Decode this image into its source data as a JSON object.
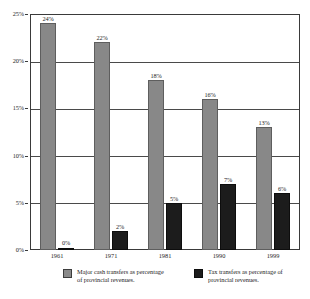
{
  "chart_data": {
    "type": "bar",
    "title": "",
    "subtitle": "",
    "xlabel": "",
    "ylabel": "",
    "categories": [
      "1961",
      "1971",
      "1981",
      "1990",
      "1999"
    ],
    "series": [
      {
        "name": "Major cash transfers as percentage of provincial revenues.",
        "color": "#888888",
        "values": [
          24,
          22,
          18,
          16,
          13
        ],
        "labels": [
          "24%",
          "22%",
          "18%",
          "16%",
          "13%"
        ]
      },
      {
        "name": "Tax transfers as percentage of provincial revenues.",
        "color": "#1c1c1c",
        "values": [
          0,
          2,
          5,
          7,
          6
        ],
        "labels": [
          "0%",
          "2%",
          "5%",
          "7%",
          "6%"
        ]
      }
    ],
    "ylim": [
      0,
      25
    ],
    "y_ticks": [
      0,
      5,
      10,
      15,
      20,
      25
    ],
    "y_tick_labels": [
      "0%",
      "5%",
      "10%",
      "15%",
      "20%",
      "25%"
    ],
    "grid": "horizontal",
    "legend_position": "bottom"
  },
  "legend": {
    "entries": [
      {
        "label": "Major cash transfers as percentage of provincial revenues.",
        "swatch": "grey-swatch"
      },
      {
        "label": "Tax transfers as percentage of provincial revenues.",
        "swatch": "black-swatch"
      }
    ]
  }
}
